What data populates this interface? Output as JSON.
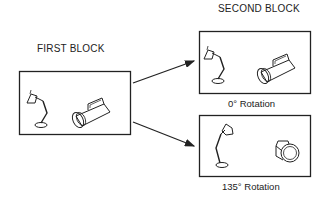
{
  "diagram": {
    "first_block": {
      "title": "FIRST BLOCK",
      "objects": [
        "desk-lamp",
        "flashlight"
      ]
    },
    "second_block": {
      "title": "SECOND BLOCK",
      "panels": [
        {
          "caption": "0° Rotation",
          "objects": [
            "desk-lamp",
            "flashlight"
          ]
        },
        {
          "caption": "135° Rotation",
          "objects": [
            "desk-lamp-rotated",
            "flashlight-rotated"
          ]
        }
      ]
    },
    "colors": {
      "stroke": "#222222",
      "background": "#ffffff"
    }
  }
}
